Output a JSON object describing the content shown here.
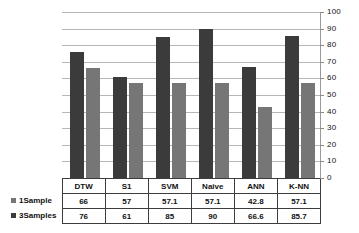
{
  "chart_data": {
    "type": "bar",
    "title": "",
    "xlabel": "",
    "ylabel": "",
    "categories": [
      "DTW",
      "S1",
      "SVM",
      "Naive",
      "ANN",
      "K-NN"
    ],
    "series": [
      {
        "name": "1Sample",
        "values": [
          66,
          57,
          57.1,
          57.1,
          42.8,
          57.1
        ],
        "color": "#767676"
      },
      {
        "name": "3Samples",
        "values": [
          76,
          61,
          85,
          90,
          66.6,
          85.7
        ],
        "color": "#3b3b3b"
      }
    ],
    "ylim": [
      0,
      100
    ],
    "yticks": [
      0,
      10,
      20,
      30,
      40,
      50,
      60,
      70,
      80,
      90,
      100
    ],
    "ytick_labels": [
      "0",
      "10",
      "20",
      "30",
      "40",
      "50",
      "60",
      "70",
      "80",
      "90",
      "100"
    ],
    "grid": true,
    "y_axis_position": "right",
    "legend": "data-table",
    "data_table_visible": true,
    "table_rows": [
      {
        "label": "1Sample",
        "swatch": "light",
        "cells": [
          "66",
          "57",
          "57.1",
          "57.1",
          "42.8",
          "57.1"
        ]
      },
      {
        "label": "3Samples",
        "swatch": "dark",
        "cells": [
          "76",
          "61",
          "85",
          "90",
          "66.6",
          "85.7"
        ]
      }
    ],
    "table_header": [
      "DTW",
      "S1",
      "SVM",
      "Naive",
      "ANN",
      "K-NN"
    ]
  }
}
